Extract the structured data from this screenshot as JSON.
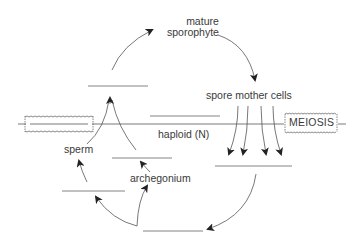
{
  "diagram": {
    "labels": {
      "mature_sporophyte_line1": "mature",
      "mature_sporophyte_line2": "sporophyte",
      "spore_mother_cells": "spore  mother  cells",
      "meiosis": "MEIOSIS",
      "haploid": "haploid (N)",
      "sperm": "sperm",
      "archegonium": "archegonium"
    },
    "blanks": [
      {
        "id": "blank-top",
        "x1": 88,
        "x2": 148,
        "y": 86
      },
      {
        "id": "blank-diploid-box",
        "x1": 27,
        "x2": 90,
        "y": 124
      },
      {
        "id": "blank-diploid",
        "x1": 150,
        "x2": 220,
        "y": 116
      },
      {
        "id": "blank-antheridium",
        "x1": 112,
        "x2": 172,
        "y": 158
      },
      {
        "id": "blank-spores",
        "x1": 215,
        "x2": 292,
        "y": 166
      },
      {
        "id": "blank-gametophyte",
        "x1": 62,
        "x2": 125,
        "y": 191
      },
      {
        "id": "blank-bottom",
        "x1": 143,
        "x2": 203,
        "y": 231
      }
    ],
    "colors": {
      "line": "#555555",
      "text": "#3a3a3a",
      "arrowhead": "#222222"
    }
  }
}
